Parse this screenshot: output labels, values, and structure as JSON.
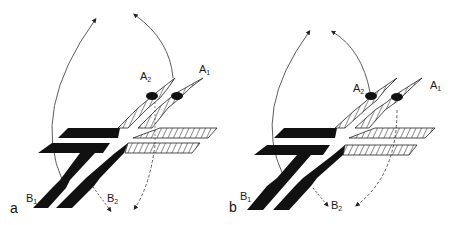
{
  "figure": {
    "panels": [
      {
        "id": "a",
        "letter": "a",
        "labels": {
          "A1": "A",
          "A1_sub": "1",
          "A2": "A",
          "A2_sub": "2",
          "B1": "B",
          "B1_sub": "1",
          "B2": "B",
          "B2_sub": "2"
        }
      },
      {
        "id": "b",
        "letter": "b",
        "labels": {
          "A1": "A",
          "A1_sub": "1",
          "A2": "A",
          "A2_sub": "2",
          "B1": "B",
          "B1_sub": "1",
          "B2": "B",
          "B2_sub": "2"
        }
      }
    ],
    "colors": {
      "ink": "#111111",
      "hatch": "#222222",
      "background": "#ffffff"
    }
  }
}
